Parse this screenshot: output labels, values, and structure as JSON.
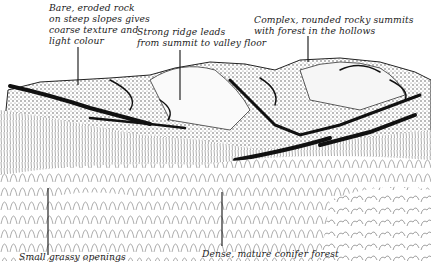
{
  "figure": {
    "type": "landscape-sketch",
    "annotations": [
      {
        "id": "bare-rock",
        "text": "Bare, eroded rock\non steep slopes gives\ncoarse texture and\nlight colour"
      },
      {
        "id": "strong-ridge",
        "text": "Strong ridge leads\nfrom summit to valley floor"
      },
      {
        "id": "rocky-summits",
        "text": "Complex, rounded rocky summits\nwith forest in the hollows"
      },
      {
        "id": "grassy-openings",
        "text": "Small grassy openings"
      },
      {
        "id": "conifer-forest",
        "text": "Dense, mature conifer forest"
      }
    ]
  },
  "colors": {
    "ink": "#1a1a1a",
    "paper": "#ffffff",
    "hatch": "#6a6a6a"
  }
}
